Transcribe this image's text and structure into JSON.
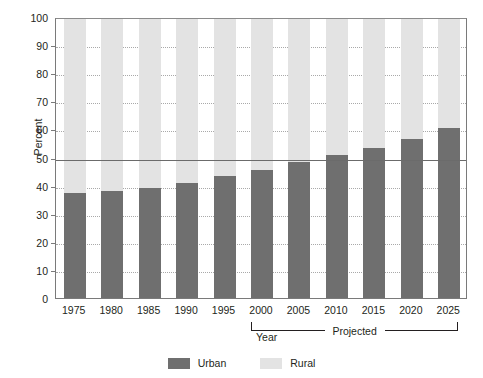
{
  "chart_data": {
    "type": "bar",
    "stacked": true,
    "title": "",
    "subtitle": "",
    "xlabel": "Year",
    "ylabel": "Percent",
    "categories": [
      "1975",
      "1980",
      "1985",
      "1990",
      "1995",
      "2000",
      "2005",
      "2010",
      "2015",
      "2020",
      "2025"
    ],
    "series": [
      {
        "name": "Urban",
        "color": "#6f6f6f",
        "values": [
          37.4,
          38.0,
          39.0,
          41.0,
          43.5,
          45.5,
          48.5,
          51.0,
          53.5,
          56.5,
          60.5
        ]
      },
      {
        "name": "Rural",
        "color": "#e3e3e3",
        "values": [
          62.6,
          62.0,
          61.0,
          59.0,
          56.5,
          54.5,
          51.5,
          49.0,
          46.5,
          43.5,
          39.5
        ]
      }
    ],
    "ylim": [
      0,
      100
    ],
    "ytick_labels": [
      "0",
      "10",
      "20",
      "30",
      "40",
      "50",
      "60",
      "70",
      "80",
      "90",
      "100"
    ],
    "ytick_values": [
      0,
      10,
      20,
      30,
      40,
      50,
      60,
      70,
      80,
      90,
      100
    ],
    "grid": "horizontal-dotted",
    "reference_line": {
      "value": 50,
      "label": "",
      "color": "#6b6b6b"
    },
    "annotation": {
      "label": "Projected",
      "from_category": "2000",
      "to_category": "2025"
    },
    "legend": {
      "position": "bottom-center",
      "entries": [
        {
          "label": "Urban",
          "color": "#6f6f6f"
        },
        {
          "label": "Rural",
          "color": "#e3e3e3"
        }
      ]
    }
  },
  "colors": {
    "urban": "#6f6f6f",
    "rural": "#e3e3e3",
    "axis": "#7a7a7a",
    "grid": "#a9a9a9",
    "text": "#231f20",
    "reference": "#6b6b6b",
    "background": "#ffffff"
  }
}
